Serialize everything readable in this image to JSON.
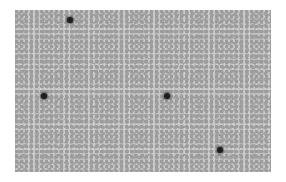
{
  "image": {
    "subject": "blood smear micrograph",
    "tone": "grayscale",
    "background_color": "#b4b4b4",
    "frame": {
      "x": 15,
      "y": 10,
      "width": 256,
      "height": 162
    },
    "dark_cells": [
      {
        "x": 70,
        "y": 20
      },
      {
        "x": 44,
        "y": 96
      },
      {
        "x": 167,
        "y": 96
      },
      {
        "x": 220,
        "y": 150
      }
    ]
  }
}
